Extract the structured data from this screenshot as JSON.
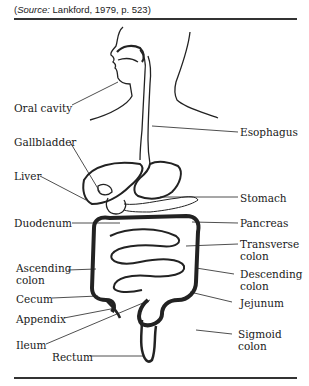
{
  "caption": {
    "prefix": "(",
    "source_word": "Source:",
    "rest": " Lankford, 1979, p. 523)"
  },
  "labels": {
    "oral_cavity": "Oral cavity",
    "gallbladder": "Gallbladder",
    "liver": "Liver",
    "duodenum": "Duodenum",
    "esophagus": "Esophagus",
    "stomach": "Stomach",
    "pancreas": "Pancreas",
    "transverse_1": "Transverse",
    "transverse_2": "colon",
    "ascending_1": "Ascending",
    "ascending_2": "colon",
    "descending_1": "Descending",
    "descending_2": "colon",
    "cecum": "Cecum",
    "jejunum": "Jejunum",
    "appendix": "Appendix",
    "sigmoid_1": "Sigmoid",
    "sigmoid_2": "colon",
    "ileum": "Ileum",
    "rectum": "Rectum"
  }
}
